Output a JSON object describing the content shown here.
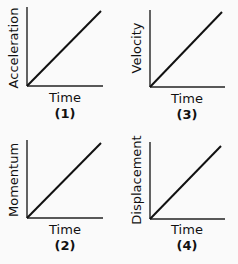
{
  "chart_data": [
    {
      "type": "line",
      "id": "(1)",
      "xlabel": "Time",
      "ylabel": "Acceleration",
      "series": [
        {
          "name": "Acceleration",
          "x": [
            0,
            1
          ],
          "y": [
            0,
            1
          ]
        }
      ],
      "axes": {
        "x": [
          27,
          86,
          103,
          86
        ],
        "y": [
          27,
          86,
          27,
          7
        ]
      },
      "line": [
        27,
        86,
        101,
        11
      ],
      "label_pos": {
        "ylabel": [
          18,
          48
        ],
        "xlabel": [
          65,
          98
        ],
        "num": [
          65,
          114
        ]
      }
    },
    {
      "type": "line",
      "id": "(3)",
      "xlabel": "Time",
      "ylabel": "Velocity",
      "series": [
        {
          "name": "Velocity",
          "x": [
            0,
            1
          ],
          "y": [
            0,
            1
          ]
        }
      ],
      "axes": {
        "x": [
          150,
          87,
          225,
          87
        ],
        "y": [
          150,
          87,
          150,
          10
        ]
      },
      "line": [
        150,
        87,
        222,
        12
      ],
      "label_pos": {
        "ylabel": [
          141,
          48
        ],
        "xlabel": [
          187,
          99
        ],
        "num": [
          187,
          115
        ]
      }
    },
    {
      "type": "line",
      "id": "(2)",
      "xlabel": "Time",
      "ylabel": "Momentum",
      "series": [
        {
          "name": "Momentum",
          "x": [
            0,
            1
          ],
          "y": [
            0,
            1
          ]
        }
      ],
      "axes": {
        "x": [
          27,
          218,
          103,
          218
        ],
        "y": [
          27,
          218,
          27,
          140
        ]
      },
      "line": [
        27,
        218,
        101,
        143
      ],
      "label_pos": {
        "ylabel": [
          18,
          180
        ],
        "xlabel": [
          65,
          230
        ],
        "num": [
          65,
          246
        ]
      }
    },
    {
      "type": "line",
      "id": "(4)",
      "xlabel": "Time",
      "ylabel": "Displacement",
      "series": [
        {
          "name": "Displacement",
          "x": [
            0,
            1
          ],
          "y": [
            0,
            1
          ]
        }
      ],
      "axes": {
        "x": [
          150,
          219,
          225,
          219
        ],
        "y": [
          150,
          219,
          150,
          142
        ]
      },
      "line": [
        150,
        219,
        221,
        146
      ],
      "label_pos": {
        "ylabel": [
          141,
          180
        ],
        "xlabel": [
          187,
          230
        ],
        "num": [
          187,
          246
        ]
      }
    }
  ],
  "colors": {
    "axis": "#222222",
    "line": "#111111",
    "text": "#111111",
    "background": "#fafafa"
  }
}
